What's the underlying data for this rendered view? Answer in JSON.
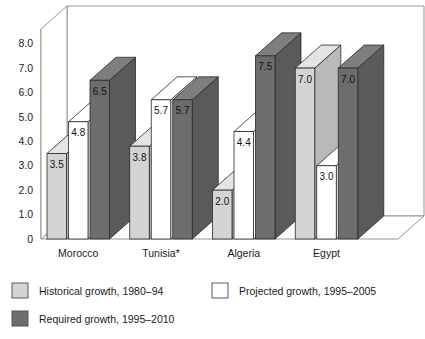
{
  "chart_data": {
    "type": "bar",
    "title": "",
    "subtitle": "",
    "xlabel": "",
    "ylabel": "",
    "categories": [
      "Morocco",
      "Tunisia*",
      "Algeria",
      "Egypt"
    ],
    "series": [
      {
        "name": "Historical growth, 1980–94",
        "color": "#d4d4d4",
        "side_color": "#b9b9b9",
        "top_color": "#e4e4e4",
        "values": [
          3.5,
          3.8,
          2.0,
          7.0
        ],
        "labels": [
          "3.5",
          "3.8",
          "2.0",
          "7.0"
        ]
      },
      {
        "name": "Projected growth, 1995–2005",
        "color": "#ffffff",
        "side_color": "#ffffff",
        "top_color": "#ffffff",
        "values": [
          4.8,
          5.7,
          4.4,
          3.0
        ],
        "labels": [
          "4.8",
          "5.7",
          "4.4",
          "3.0"
        ]
      },
      {
        "name": "Required growth, 1995–2010",
        "color": "#6d6d6d",
        "side_color": "#5a5a5a",
        "top_color": "#7e7e7e",
        "values": [
          6.5,
          5.7,
          7.5,
          7.0
        ],
        "labels": [
          "6.5",
          "5.7",
          "7.5",
          "7.0"
        ]
      }
    ],
    "ylim": [
      0,
      8.6
    ],
    "yticks": [
      0,
      1,
      2,
      3,
      4,
      5,
      6,
      7,
      8
    ],
    "ytick_labels": [
      "0",
      "1.0",
      "2.0",
      "3.0",
      "4.0",
      "5.0",
      "6.0",
      "7.0",
      "8.0"
    ],
    "grid": true,
    "legend_position": "bottom-left",
    "style": "3d-column"
  },
  "legend": {
    "items": [
      {
        "label": "Historical growth, 1980–94",
        "swatch": "#d4d4d4"
      },
      {
        "label": "Projected growth, 1995–2005",
        "swatch": "#ffffff"
      },
      {
        "label": "Required growth, 1995–2010",
        "swatch": "#6d6d6d"
      }
    ]
  },
  "axes": {
    "y_tick_0": "0",
    "y_tick_1": "1.0",
    "y_tick_2": "2.0",
    "y_tick_3": "3.0",
    "y_tick_4": "4.0",
    "y_tick_5": "5.0",
    "y_tick_6": "6.0",
    "y_tick_7": "7.0",
    "y_tick_8": "8.0"
  },
  "categories_text": {
    "c0": "Morocco",
    "c1": "Tunisia*",
    "c2": "Algeria",
    "c3": "Egypt"
  }
}
